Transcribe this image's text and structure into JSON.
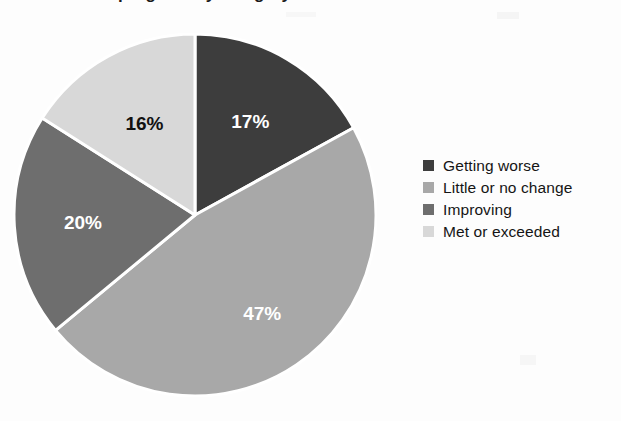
{
  "figure": {
    "title_partial": "progress by category",
    "background_color": "#fdfdfd"
  },
  "chart_data": {
    "type": "pie",
    "title": "",
    "xlabel": "",
    "ylabel": "",
    "categories": [
      "Getting worse",
      "Little or no change",
      "Improving",
      "Met or exceeded"
    ],
    "values": [
      17,
      47,
      20,
      16
    ],
    "value_labels": [
      "17%",
      "47%",
      "20%",
      "16%"
    ],
    "colors": [
      "#3d3d3d",
      "#a8a8a8",
      "#6e6e6e",
      "#d8d8d8"
    ],
    "label_text_colors": [
      "#ffffff",
      "#ffffff",
      "#ffffff",
      "#111111"
    ],
    "units": "percent",
    "start_angle_deg": 0,
    "direction": "clockwise",
    "slice_gap_color": "#ffffff",
    "legend_position": "right",
    "grid": false
  },
  "legend": {
    "items": [
      {
        "label": "Getting worse",
        "color": "#3d3d3d"
      },
      {
        "label": "Little or no change",
        "color": "#a8a8a8"
      },
      {
        "label": "Improving",
        "color": "#6e6e6e"
      },
      {
        "label": "Met or exceeded",
        "color": "#d8d8d8"
      }
    ]
  },
  "slice_labels": {
    "s0": "17%",
    "s1": "47%",
    "s2": "20%",
    "s3": "16%"
  }
}
